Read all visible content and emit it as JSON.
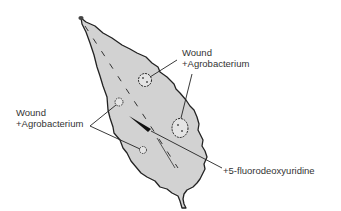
{
  "diagram": {
    "colors": {
      "leaf_fill": "#d2d2d2",
      "outline": "#222222",
      "text": "#333333",
      "background": "#ffffff"
    },
    "labels": {
      "upper_right": {
        "line1": "Wound",
        "line2": "+Agrobacterium"
      },
      "left": {
        "line1": "Wound",
        "line2": "+Agrobacterium"
      },
      "lower_right": {
        "line1": "+5-fluorodeoxyuridine"
      }
    }
  }
}
